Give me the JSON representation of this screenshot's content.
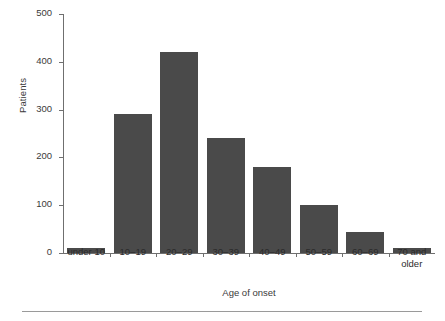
{
  "chart_data": {
    "type": "bar",
    "title": "",
    "subtitle": "",
    "xlabel": "Age of onset",
    "ylabel": "Patients",
    "categories": [
      "under 10",
      "10–19",
      "20–29",
      "30–39",
      "40–49",
      "50–59",
      "60–69",
      "70 and\nolder"
    ],
    "values": [
      10,
      290,
      420,
      240,
      180,
      100,
      45,
      10
    ],
    "ylim": [
      0,
      500
    ],
    "yticks": [
      0,
      100,
      200,
      300,
      400,
      500
    ],
    "ytick_labels": [
      "0",
      "100",
      "200",
      "300",
      "400",
      "500"
    ],
    "grid": false,
    "legend": null,
    "bar_color": "#4a4a4a",
    "axis_color": "#6f6f6f",
    "background": "#ffffff"
  },
  "figure": {
    "bottom_rule": "",
    "y_axis_title": "Patients",
    "x_axis_title": "Age of onset"
  }
}
